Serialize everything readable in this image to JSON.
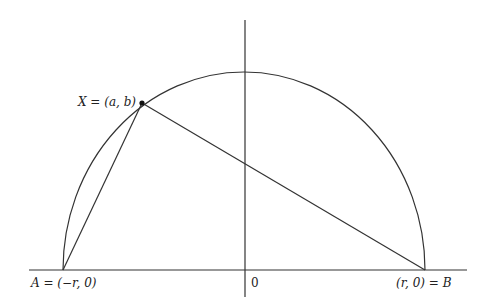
{
  "diagram": {
    "title": "",
    "labels": {
      "point_a": "A = (−r, 0)",
      "point_b": "(r, 0) = B",
      "point_x": "X = (a, b)",
      "origin": "0"
    },
    "geometry": {
      "x_axis": {
        "x1": 29,
        "x2": 467,
        "y": 270
      },
      "y_axis": {
        "x": 245,
        "y1": 20,
        "y2": 297
      },
      "semicircle": {
        "cx": 244,
        "cy": 270,
        "rx": 181,
        "ry": 198
      },
      "A": {
        "x": 63,
        "y": 270
      },
      "B": {
        "x": 425,
        "y": 270
      },
      "X": {
        "x": 142,
        "y": 103
      }
    },
    "colors": {
      "stroke": "#333333",
      "text": "#222222"
    }
  }
}
